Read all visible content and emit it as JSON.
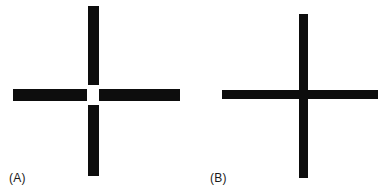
{
  "figure": {
    "width": 388,
    "height": 193,
    "background_color": "#ffffff",
    "ink_color": "#0d0d0d"
  },
  "panels": [
    {
      "id": "A",
      "caption": "(A)",
      "figure_type": "cross-with-gap",
      "horizontal_bar": {
        "thickness_px": 12,
        "left_px": 13,
        "right_px": 180,
        "total_length_px": 167,
        "segments": [
          {
            "name": "left-arm",
            "left_px": 13,
            "width_px": 74
          },
          {
            "name": "right-arm",
            "left_px": 98,
            "width_px": 82
          }
        ]
      },
      "vertical_bar": {
        "thickness_px": 11,
        "top_px": 6,
        "bottom_px": 176,
        "total_length_px": 170,
        "segments": [
          {
            "name": "top-arm",
            "top_px": 6,
            "height_px": 79
          },
          {
            "name": "bottom-arm",
            "top_px": 105,
            "height_px": 71
          }
        ]
      },
      "intersection": {
        "has_gap": true,
        "gap_color": "#ffffff",
        "gap_width_px": 11,
        "gap_height_px": 20,
        "center_x_px": 93,
        "center_y_px": 95
      }
    },
    {
      "id": "B",
      "caption": "(B)",
      "figure_type": "solid-cross",
      "horizontal_bar": {
        "thickness_px": 9,
        "left_px": 222,
        "right_px": 378,
        "total_length_px": 156,
        "segments": [
          {
            "name": "full-bar",
            "left_px": 222,
            "width_px": 156
          }
        ]
      },
      "vertical_bar": {
        "thickness_px": 9,
        "top_px": 14,
        "bottom_px": 178,
        "total_length_px": 164,
        "segments": [
          {
            "name": "full-bar",
            "top_px": 14,
            "height_px": 164
          }
        ]
      },
      "intersection": {
        "has_gap": false,
        "center_x_px": 303,
        "center_y_px": 94
      }
    }
  ]
}
